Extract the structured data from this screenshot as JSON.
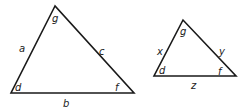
{
  "triangles": [
    {
      "id": "large",
      "vertices": {
        "top": "g",
        "bottom_left": "d",
        "bottom_right": "f"
      },
      "sides": {
        "left": "a",
        "right": "c",
        "bottom": "b"
      }
    },
    {
      "id": "small",
      "vertices": {
        "top": "g",
        "bottom_left": "d",
        "bottom_right": "f"
      },
      "sides": {
        "left": "x",
        "right": "y",
        "bottom": "z"
      }
    }
  ],
  "colors": {
    "stroke": "#1a1a1a",
    "text": "#222222",
    "background": "#ffffff"
  }
}
